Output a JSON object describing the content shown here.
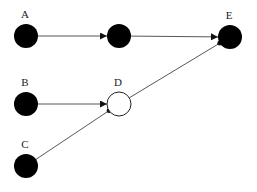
{
  "diagram": {
    "type": "directed-graph",
    "colors": {
      "filled_node": "#000000",
      "open_node_fill": "#ffffff",
      "open_node_stroke": "#222222",
      "edge": "#444444",
      "label": "#222222"
    },
    "nodes": [
      {
        "id": "A",
        "label": "A",
        "x": 26,
        "y": 36,
        "r": 12,
        "filled": true
      },
      {
        "id": "M",
        "label": "",
        "x": 119,
        "y": 36,
        "r": 12,
        "filled": true
      },
      {
        "id": "E",
        "label": "E",
        "x": 230,
        "y": 37,
        "r": 12,
        "filled": true
      },
      {
        "id": "B",
        "label": "B",
        "x": 26,
        "y": 104,
        "r": 12,
        "filled": true
      },
      {
        "id": "D",
        "label": "D",
        "x": 119,
        "y": 104,
        "r": 12,
        "filled": false
      },
      {
        "id": "C",
        "label": "C",
        "x": 26,
        "y": 166,
        "r": 12,
        "filled": true
      }
    ],
    "edges": [
      {
        "from": "A",
        "to": "M",
        "head": "arrow"
      },
      {
        "from": "M",
        "to": "E",
        "head": "arrow"
      },
      {
        "from": "B",
        "to": "D",
        "head": "arrow"
      },
      {
        "from": "C",
        "to": "D",
        "head": "dot"
      },
      {
        "from": "D",
        "to": "E",
        "head": "dot"
      }
    ]
  }
}
